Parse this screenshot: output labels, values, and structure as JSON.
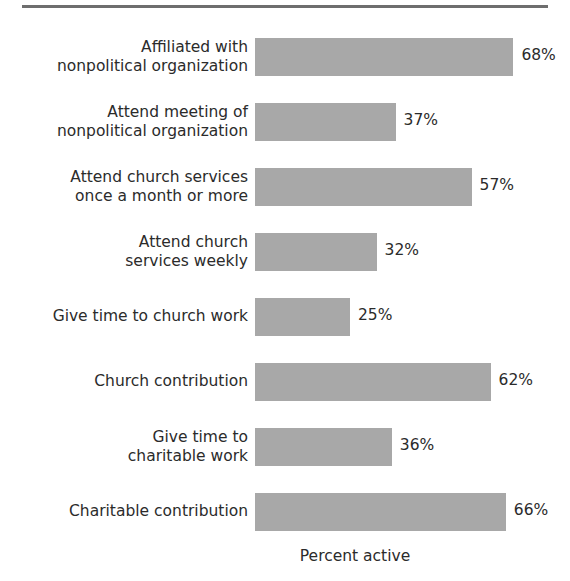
{
  "chart_data": {
    "type": "bar",
    "orientation": "horizontal",
    "title": "",
    "subtitle": "",
    "xlabel": "Percent active",
    "ylabel": "",
    "xlim": [
      0,
      100
    ],
    "grid": false,
    "legend": false,
    "value_suffix": "%",
    "categories": [
      "Affiliated with\nnonpolitical organization",
      "Attend meeting of\nnonpolitical organization",
      "Attend church services\nonce a month or more",
      "Attend church\nservices weekly",
      "Give time to church work",
      "Church contribution",
      "Give time to\ncharitable work",
      "Charitable contribution"
    ],
    "values": [
      68,
      37,
      57,
      32,
      25,
      62,
      36,
      66
    ],
    "value_labels": [
      "68%",
      "37%",
      "57%",
      "32%",
      "25%",
      "62%",
      "36%",
      "66%"
    ],
    "bars": [
      {
        "category": "Affiliated with\nnonpolitical organization",
        "value": 68,
        "label": "68%",
        "lines": 2
      },
      {
        "category": "Attend meeting of\nnonpolitical organization",
        "value": 37,
        "label": "37%",
        "lines": 2
      },
      {
        "category": "Attend church services\nonce a month or more",
        "value": 57,
        "label": "57%",
        "lines": 2
      },
      {
        "category": "Attend church\nservices weekly",
        "value": 32,
        "label": "32%",
        "lines": 2
      },
      {
        "category": "Give time to church work",
        "value": 25,
        "label": "25%",
        "lines": 1
      },
      {
        "category": "Church contribution",
        "value": 62,
        "label": "62%",
        "lines": 1
      },
      {
        "category": "Give time to\ncharitable work",
        "value": 36,
        "label": "36%",
        "lines": 2
      },
      {
        "category": "Charitable contribution",
        "value": 66,
        "label": "66%",
        "lines": 1
      }
    ],
    "colors": {
      "bar_fill": "#a8a8a8",
      "text": "#2b2b2b",
      "rule": "#6e6e6e",
      "background": "#ffffff"
    }
  }
}
